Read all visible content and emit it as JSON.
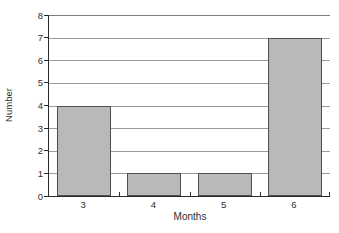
{
  "chart_data": {
    "type": "bar",
    "categories": [
      "3",
      "4",
      "5",
      "6"
    ],
    "values": [
      4,
      1,
      1,
      7
    ],
    "title": "",
    "xlabel": "Months",
    "ylabel": "Number",
    "ylim": [
      0,
      8
    ],
    "yticks": [
      0,
      1,
      2,
      3,
      4,
      5,
      6,
      7,
      8
    ],
    "grid": "horizontal",
    "legend": "none",
    "colors": {
      "bar_fill": "#b9b9b9",
      "bar_border": "#4f4f4f",
      "gridline": "#9a9a9a",
      "axis": "#2b2b2b",
      "text": "#2e2e2e",
      "background": "#ffffff"
    }
  }
}
